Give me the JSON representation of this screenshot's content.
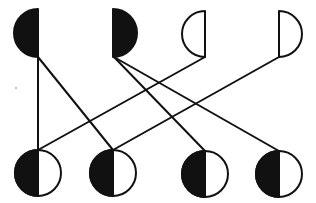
{
  "diagram": {
    "type": "genetic-cross-diagram",
    "colors": {
      "background": "#ffffff",
      "ink": "#111111",
      "fill": "#111111"
    },
    "stroke_width": 2,
    "top_row": [
      {
        "id": "p1",
        "cx": 38,
        "cy": 33,
        "r": 24,
        "half": "left",
        "filled": true,
        "label": "filled-left-half"
      },
      {
        "id": "p2",
        "cx": 113,
        "cy": 33,
        "r": 24,
        "half": "right",
        "filled": true,
        "label": "filled-right-half"
      },
      {
        "id": "p3",
        "cx": 205,
        "cy": 34,
        "r": 23,
        "half": "left",
        "filled": false,
        "label": "empty-left-half"
      },
      {
        "id": "p4",
        "cx": 279,
        "cy": 34,
        "r": 23,
        "half": "right",
        "filled": false,
        "label": "empty-right-half"
      }
    ],
    "bottom_row": [
      {
        "id": "o1",
        "cx": 38,
        "cy": 173,
        "r": 23,
        "left": "filled",
        "right": "empty"
      },
      {
        "id": "o2",
        "cx": 113,
        "cy": 173,
        "r": 23,
        "left": "filled",
        "right": "empty"
      },
      {
        "id": "o3",
        "cx": 205,
        "cy": 174,
        "r": 23,
        "left": "filled",
        "right": "empty"
      },
      {
        "id": "o4",
        "cx": 279,
        "cy": 174,
        "r": 23,
        "left": "filled",
        "right": "empty"
      }
    ],
    "connections": [
      {
        "from": "p1",
        "to": "o1",
        "x1": 38,
        "y1": 57,
        "x2": 38,
        "y2": 150
      },
      {
        "from": "p1",
        "to": "o2",
        "x1": 38,
        "y1": 57,
        "x2": 113,
        "y2": 150
      },
      {
        "from": "p2",
        "to": "o3",
        "x1": 114,
        "y1": 57,
        "x2": 205,
        "y2": 151
      },
      {
        "from": "p2",
        "to": "o4",
        "x1": 114,
        "y1": 57,
        "x2": 279,
        "y2": 151
      },
      {
        "from": "p3",
        "to": "o1",
        "x1": 205,
        "y1": 57,
        "x2": 38,
        "y2": 150
      },
      {
        "from": "p4",
        "to": "o2",
        "x1": 279,
        "y1": 57,
        "x2": 113,
        "y2": 150
      }
    ],
    "specks": [
      {
        "x": 16,
        "y": 88,
        "r": 0.8
      }
    ]
  }
}
